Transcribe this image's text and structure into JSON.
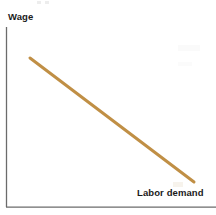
{
  "figure": {
    "background_color": "#ffffff",
    "width": 216,
    "height": 215
  },
  "labels": {
    "y_axis": "Wage",
    "series": "Labor demand"
  },
  "colors": {
    "curve": "#c08f45",
    "axis": "#6b6b6b",
    "text": "#1a1a1a",
    "background": "#ffffff"
  },
  "axes": {
    "origin": {
      "x": 6.5,
      "y": 207
    },
    "y_axis_top": {
      "x": 6.5,
      "y": 27
    },
    "x_axis_right": {
      "x": 216,
      "y": 207
    },
    "line_width": 1.2,
    "ticks": [],
    "tick_labels": []
  },
  "chart_data": {
    "type": "line",
    "title": "",
    "subtitle": "",
    "xlabel": "",
    "ylabel": "Wage",
    "grid": false,
    "legend": "inline-label",
    "axis_ticks": false,
    "xlim": [
      0,
      1
    ],
    "ylim": [
      0,
      1
    ],
    "series": [
      {
        "name": "Labor demand",
        "color": "#c08f45",
        "line_width": 3,
        "label_position": "bottom-right",
        "points_px": [
          [
            30,
            58
          ],
          [
            194,
            182
          ]
        ],
        "x": [
          0.13,
          0.89
        ],
        "values": [
          0.83,
          0.14
        ],
        "description": "Downward-sloping straight labor demand curve"
      }
    ]
  }
}
